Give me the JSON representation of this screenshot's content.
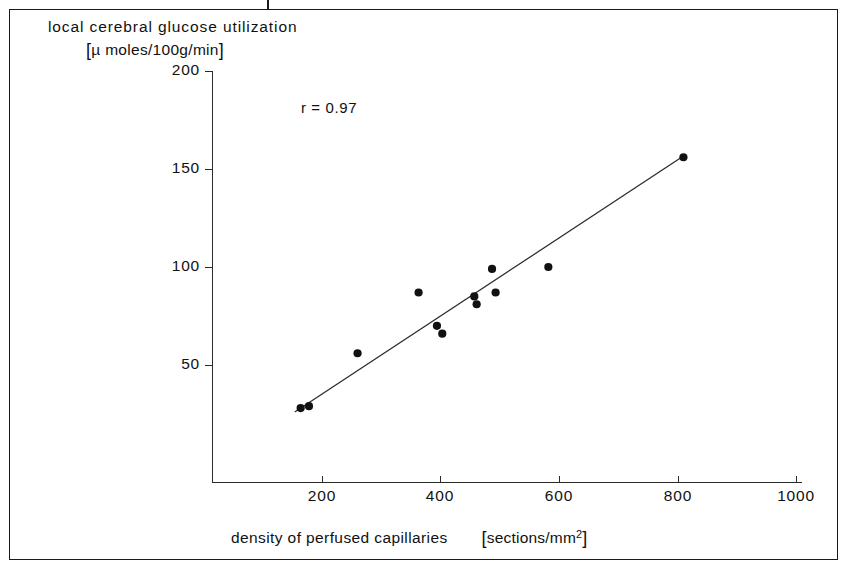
{
  "figure": {
    "y_axis_title_line1": "local cerebral glucose  utilization",
    "y_axis_title_line2_open": "[",
    "y_axis_title_line2_text": "µ moles/100g/min",
    "y_axis_title_line2_close": "]",
    "x_axis_title": "density of perfused capillaries",
    "x_axis_units_open": "[",
    "x_axis_units_text": "sections/mm",
    "x_axis_units_sup": "2",
    "x_axis_units_close": "]",
    "annotation": "r = 0.97",
    "line_color": "#2b2b2b",
    "point_color": "#111111",
    "axis_color": "#2b2b2b",
    "frame_color": "#1a1a1a"
  },
  "chart_data": {
    "type": "scatter",
    "xlabel": "density of perfused capillaries [sections/mm2]",
    "ylabel": "local cerebral glucose utilization [µ moles/100g/min]",
    "xlim": [
      115,
      1035
    ],
    "ylim": [
      0,
      208
    ],
    "xticks": [
      200,
      400,
      600,
      800,
      1000
    ],
    "xtick_labels": [
      "200",
      "400",
      "600",
      "800",
      "1000"
    ],
    "yticks": [
      50,
      100,
      150,
      200
    ],
    "ytick_labels": [
      "50",
      "100",
      "150",
      "200"
    ],
    "grid": false,
    "legend": false,
    "correlation_r": 0.97,
    "annotations": [
      {
        "text": "r = 0.97",
        "x": 355,
        "y": 183
      }
    ],
    "points": [
      {
        "x": 164,
        "y": 28
      },
      {
        "x": 178,
        "y": 29
      },
      {
        "x": 260,
        "y": 56
      },
      {
        "x": 363,
        "y": 87
      },
      {
        "x": 394,
        "y": 70
      },
      {
        "x": 403,
        "y": 66
      },
      {
        "x": 457,
        "y": 85
      },
      {
        "x": 461,
        "y": 81
      },
      {
        "x": 487,
        "y": 99
      },
      {
        "x": 493,
        "y": 87
      },
      {
        "x": 582,
        "y": 100
      },
      {
        "x": 810,
        "y": 156
      }
    ],
    "series": [
      {
        "name": "measurements",
        "marker": "filled-circle",
        "x": [
          164,
          178,
          260,
          363,
          394,
          403,
          457,
          461,
          487,
          493,
          582,
          810
        ],
        "y": [
          28,
          29,
          56,
          87,
          70,
          66,
          85,
          81,
          99,
          87,
          100,
          156
        ]
      },
      {
        "name": "regression-line",
        "type": "line",
        "x": [
          154,
          812
        ],
        "y": [
          26,
          157
        ]
      }
    ]
  }
}
